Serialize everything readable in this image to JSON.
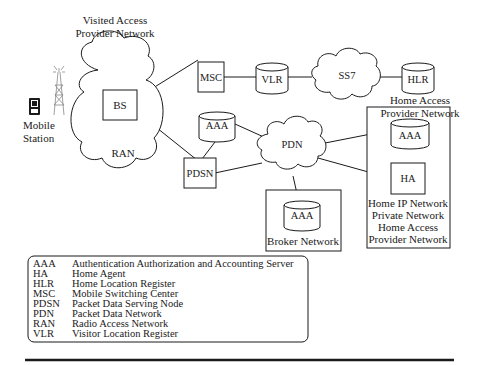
{
  "diagram": {
    "nodes": {
      "mobile_station": {
        "label_line1": "Mobile",
        "label_line2": "Station"
      },
      "visited_network": {
        "line1": "Visited Access",
        "line2": "Provider Network"
      },
      "ran": {
        "label": "RAN"
      },
      "bs": {
        "label": "BS"
      },
      "msc": {
        "label": "MSC"
      },
      "vlr": {
        "label": "VLR"
      },
      "ss7": {
        "label": "SS7"
      },
      "hlr": {
        "label": "HLR"
      },
      "home_access": {
        "line1": "Home Access",
        "line2": "Provider Network"
      },
      "aaa_visited": {
        "label": "AAA"
      },
      "pdsn": {
        "label": "PDSN"
      },
      "pdn": {
        "label": "PDN"
      },
      "aaa_broker": {
        "label": "AAA"
      },
      "broker_network": {
        "label": "Broker Network"
      },
      "aaa_home": {
        "label": "AAA"
      },
      "ha": {
        "label": "HA"
      },
      "home_ip_network": {
        "line1": "Home IP Network",
        "line2": "Private Network",
        "line3": "Home Access",
        "line4": "Provider Network"
      }
    },
    "legend": [
      {
        "abbr": "AAA",
        "meaning": "Authentication Authorization and Accounting Server"
      },
      {
        "abbr": "HA",
        "meaning": "Home Agent"
      },
      {
        "abbr": "HLR",
        "meaning": "Home Location Register"
      },
      {
        "abbr": "MSC",
        "meaning": "Mobile Switching Center"
      },
      {
        "abbr": "PDSN",
        "meaning": "Packet Data Serving Node"
      },
      {
        "abbr": "PDN",
        "meaning": "Packet Data Network"
      },
      {
        "abbr": "RAN",
        "meaning": "Radio Access Network"
      },
      {
        "abbr": "VLR",
        "meaning": "Visitor Location Register"
      }
    ]
  }
}
